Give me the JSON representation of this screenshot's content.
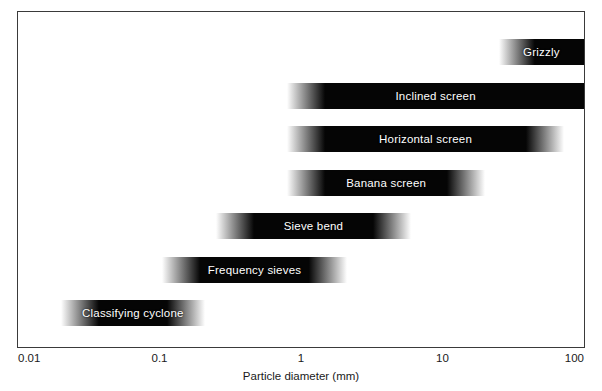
{
  "chart_data": {
    "type": "bar",
    "orientation": "horizontal",
    "title": "",
    "subtitle": "",
    "xlabel": "Particle diameter (mm)",
    "ylabel": "",
    "xscale": "log",
    "xlim": [
      0.01,
      100
    ],
    "xticks": [
      0.01,
      0.1,
      1,
      10,
      100
    ],
    "xticklabels": [
      "0.01",
      "0.1",
      "1",
      "10",
      "100"
    ],
    "grid": false,
    "legend": false,
    "bar_style": "black gradient fade at ends",
    "categories": [
      "Grizzly",
      "Inclined screen",
      "Horizontal screen",
      "Banana screen",
      "Sieve bend",
      "Frequency sieves",
      "Classifying cyclone"
    ],
    "bars": [
      {
        "label": "Grizzly",
        "x_min": 25.0,
        "x_max": 100.0,
        "fade_left": true,
        "fade_right": false
      },
      {
        "label": "Inclined screen",
        "x_min": 0.8,
        "x_max": 100.0,
        "fade_left": true,
        "fade_right": false
      },
      {
        "label": "Horizontal screen",
        "x_min": 0.8,
        "x_max": 72.0,
        "fade_left": true,
        "fade_right": true
      },
      {
        "label": "Banana screen",
        "x_min": 0.8,
        "x_max": 20.0,
        "fade_left": true,
        "fade_right": true
      },
      {
        "label": "Sieve bend",
        "x_min": 0.25,
        "x_max": 6.0,
        "fade_left": true,
        "fade_right": true
      },
      {
        "label": "Frequency sieves",
        "x_min": 0.105,
        "x_max": 2.1,
        "fade_left": true,
        "fade_right": true
      },
      {
        "label": "Classifying cyclone",
        "x_min": 0.02,
        "x_max": 0.21,
        "fade_left": true,
        "fade_right": true
      }
    ],
    "colors": {
      "bar": "#050505",
      "bar_text": "#ffffff",
      "frame": "#3a3a3a",
      "background": "#ffffff",
      "axis_text": "#1a1a1a"
    }
  },
  "axis": {
    "x_title": "Particle diameter (mm)",
    "ticks": [
      "0.01",
      "0.1",
      "1",
      "10",
      "100"
    ]
  }
}
